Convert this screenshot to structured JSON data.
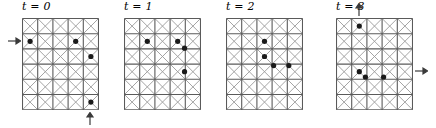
{
  "figure": {
    "grid": {
      "cols": 5,
      "rows": 6,
      "cell": 15.2,
      "diagonals": true,
      "line_color": "#5a5a5a",
      "diagonal_color": "#9a9a9a",
      "dot_color": "#1a1a1a",
      "dot_radius": 2.6
    },
    "panels": [
      {
        "id": "panel-t0",
        "label_t": "t",
        "label_eq": "=",
        "label_value": "0",
        "label_full": "t = 0",
        "left": 22,
        "particles": [
          {
            "col": 1,
            "row": 2
          },
          {
            "col": 4,
            "row": 2
          },
          {
            "col": 5,
            "row": 3
          },
          {
            "col": 5,
            "row": 6
          }
        ],
        "arrows": [
          {
            "name": "inflow-arrow-left",
            "direction": "right",
            "side": "left",
            "row": 2
          },
          {
            "name": "inflow-arrow-bottom",
            "direction": "up",
            "side": "bottom",
            "col": 5
          }
        ]
      },
      {
        "id": "panel-t1",
        "label_t": "t",
        "label_eq": "=",
        "label_value": "1",
        "label_full": "t = 1",
        "left": 124,
        "particles": [
          {
            "col": 2,
            "row": 2
          },
          {
            "col": 4,
            "row": 2
          },
          {
            "col": 4.45,
            "row": 2.45
          },
          {
            "col": 4.45,
            "row": 4
          }
        ],
        "arrows": []
      },
      {
        "id": "panel-t2",
        "label_t": "t",
        "label_eq": "=",
        "label_value": "2",
        "label_full": "t = 2",
        "left": 226,
        "particles": [
          {
            "col": 3,
            "row": 2
          },
          {
            "col": 3,
            "row": 3
          },
          {
            "col": 3.6,
            "row": 3.6
          },
          {
            "col": 4.6,
            "row": 3.6
          }
        ],
        "arrows": []
      },
      {
        "id": "panel-t3",
        "label_t": "t",
        "label_eq": "=",
        "label_value": "3",
        "label_full": "t = 3",
        "left": 336,
        "particles": [
          {
            "col": 2,
            "row": 1
          },
          {
            "col": 2,
            "row": 4
          },
          {
            "col": 2.4,
            "row": 4.35
          },
          {
            "col": 3.6,
            "row": 4.35
          }
        ],
        "arrows": [
          {
            "name": "outflow-arrow-top",
            "direction": "up",
            "side": "top",
            "col": 2
          },
          {
            "name": "outflow-arrow-right",
            "direction": "right",
            "side": "right",
            "row": 4
          }
        ]
      }
    ]
  }
}
